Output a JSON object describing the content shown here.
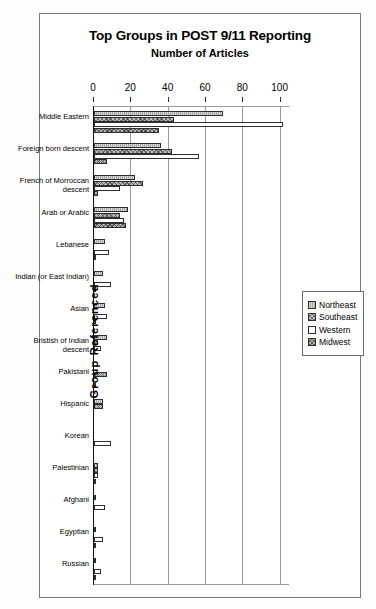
{
  "chart_data": {
    "type": "bar",
    "orientation": "horizontal",
    "title": "Top Groups in POST 9/11 Reporting",
    "subtitle": "Number of Articles",
    "xlabel": "Number of Articles",
    "ylabel": "Group Referenced",
    "xlim": [
      0,
      105
    ],
    "xticks": [
      0,
      20,
      40,
      60,
      80,
      100
    ],
    "xticklabels": [
      "0",
      "20",
      "40",
      "60",
      "80",
      "100"
    ],
    "grid": true,
    "legend_position": "right",
    "categories": [
      "Middle Eastern",
      "Foreign born descent",
      "French of Morroccan descent",
      "Arab or Arabic",
      "Lebanese",
      "Indian (or East Indian)",
      "Asian",
      "Bristish of Indian descent",
      "Pakistani",
      "Hispanic",
      "Korean",
      "Palestinian",
      "Afghani",
      "Egyptian",
      "Russian"
    ],
    "series": [
      {
        "name": "Northeast",
        "values": [
          69,
          36,
          22,
          18,
          6,
          5,
          6,
          7,
          0,
          5,
          0,
          2,
          1,
          1,
          1
        ]
      },
      {
        "name": "Southeast",
        "values": [
          43,
          42,
          26,
          14,
          0,
          0,
          0,
          2,
          7,
          5,
          0,
          2,
          0,
          0,
          0
        ]
      },
      {
        "name": "Western",
        "values": [
          101,
          56,
          14,
          16,
          8,
          9,
          7,
          4,
          0,
          0,
          9,
          2,
          6,
          5,
          4
        ]
      },
      {
        "name": "Midwest",
        "values": [
          35,
          7,
          2,
          17,
          1,
          1,
          1,
          0,
          1,
          0,
          0,
          1,
          0,
          1,
          1
        ]
      }
    ]
  },
  "legend": {
    "items": [
      {
        "label": "Northeast"
      },
      {
        "label": "Southeast"
      },
      {
        "label": "Western"
      },
      {
        "label": "Midwest"
      }
    ]
  }
}
